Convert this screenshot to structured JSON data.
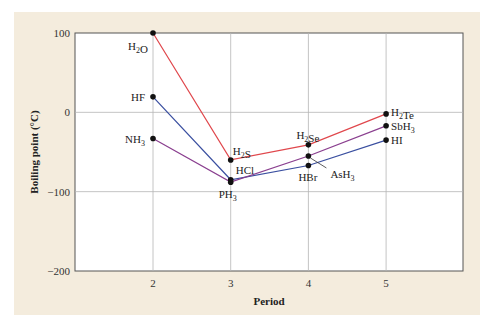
{
  "chart_data": {
    "type": "line",
    "title": "",
    "xlabel": "Period",
    "ylabel": "Boiling point (°C)",
    "x": [
      2,
      3,
      4,
      5
    ],
    "x_ticks": [
      "2",
      "3",
      "4",
      "5"
    ],
    "y_ticks": [
      "100",
      "0",
      "−100",
      "−200"
    ],
    "ylim": [
      -200,
      100
    ],
    "xlim": [
      1,
      6
    ],
    "grid": true,
    "legend": "none (inline labels)",
    "series": [
      {
        "name": "Group 16 hydrides",
        "color": "#e0474c",
        "labels": [
          "H2O",
          "H2S",
          "H2Se",
          "H2Te"
        ],
        "values": [
          100,
          -60,
          -41,
          -2
        ]
      },
      {
        "name": "Group 17 hydrides",
        "color": "#3a4fa0",
        "labels": [
          "HF",
          "HCl",
          "HBr",
          "HI"
        ],
        "values": [
          19.5,
          -85,
          -67,
          -35
        ]
      },
      {
        "name": "Group 15 hydrides",
        "color": "#8a3f8f",
        "labels": [
          "NH3",
          "PH3",
          "AsH3",
          "SbH3"
        ],
        "values": [
          -33,
          -88,
          -55,
          -17
        ]
      }
    ]
  }
}
